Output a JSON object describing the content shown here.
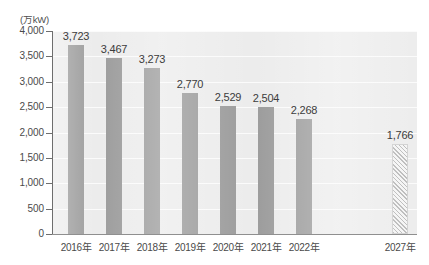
{
  "chart_data": {
    "type": "bar",
    "title": "",
    "subtitle": "",
    "xlabel": "",
    "ylabel": "",
    "unit_label": "(万kW)",
    "categories": [
      "2016年",
      "2017年",
      "2018年",
      "2019年",
      "2020年",
      "2021年",
      "2022年",
      "2027年"
    ],
    "values": [
      3723,
      3467,
      3273,
      2770,
      2529,
      2504,
      2268,
      1766
    ],
    "value_labels": [
      "3,723",
      "3,467",
      "3,273",
      "2,770",
      "2,529",
      "2,504",
      "2,268",
      "1,766"
    ],
    "series": [
      {
        "name": "実績",
        "values": [
          3723,
          3467,
          3273,
          2770,
          2529,
          2504,
          2268,
          null
        ],
        "style": "solid"
      },
      {
        "name": "見通し",
        "values": [
          null,
          null,
          null,
          null,
          null,
          null,
          null,
          1766
        ],
        "style": "hatched"
      }
    ],
    "ylim": [
      0,
      4000
    ],
    "ytick_values": [
      0,
      500,
      1000,
      1500,
      2000,
      2500,
      3000,
      3500,
      4000
    ],
    "ytick_labels": [
      "0",
      "500",
      "1,000",
      "1,500",
      "2,000",
      "2,500",
      "3,000",
      "3,500",
      "4,000"
    ],
    "grid": true,
    "grid_axis": "y",
    "legend": "none",
    "gap_before_last_category": true,
    "colors": {
      "bar": "#9b9b9b",
      "forecast_bar_hatch": "#b8b8b8",
      "forecast_bar_fill": "#f4f4f4",
      "plot_background": "#ececec",
      "gridline": "#fbfbfb",
      "axis": "#6e6e6e",
      "text": "#4a4a4a"
    }
  }
}
